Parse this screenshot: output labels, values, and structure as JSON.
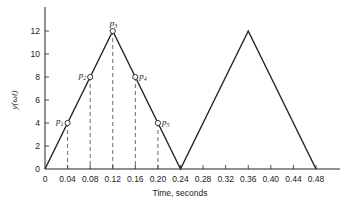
{
  "chart_data": {
    "type": "line",
    "title": "",
    "xlabel": "Time, seconds",
    "ylabel": "y(ωt)",
    "xlim": [
      0,
      0.48
    ],
    "ylim": [
      0,
      12
    ],
    "grid": false,
    "x_ticks": [
      "0",
      "0.04",
      "0.08",
      "0.12",
      "0.16",
      "0.20",
      "0.24",
      "0.28",
      "0.32",
      "0.36",
      "0.40",
      "0.44",
      "0.48"
    ],
    "y_ticks": [
      "0",
      "2",
      "4",
      "6",
      "8",
      "10",
      "12"
    ],
    "series": [
      {
        "name": "triangular wave",
        "x": [
          0,
          0.12,
          0.24,
          0.36,
          0.48
        ],
        "y": [
          0,
          12,
          0,
          12,
          0
        ]
      }
    ],
    "sample_points": [
      {
        "label": "p",
        "sub": "1",
        "x": 0.04,
        "y": 4
      },
      {
        "label": "p",
        "sub": "2",
        "x": 0.08,
        "y": 8
      },
      {
        "label": "p",
        "sub": "3",
        "x": 0.12,
        "y": 12
      },
      {
        "label": "p",
        "sub": "4",
        "x": 0.16,
        "y": 8
      },
      {
        "label": "p",
        "sub": "5",
        "x": 0.2,
        "y": 4
      }
    ],
    "annotations": "Dashed vertical lines drop from each sample point p1–p5 to the time axis"
  }
}
